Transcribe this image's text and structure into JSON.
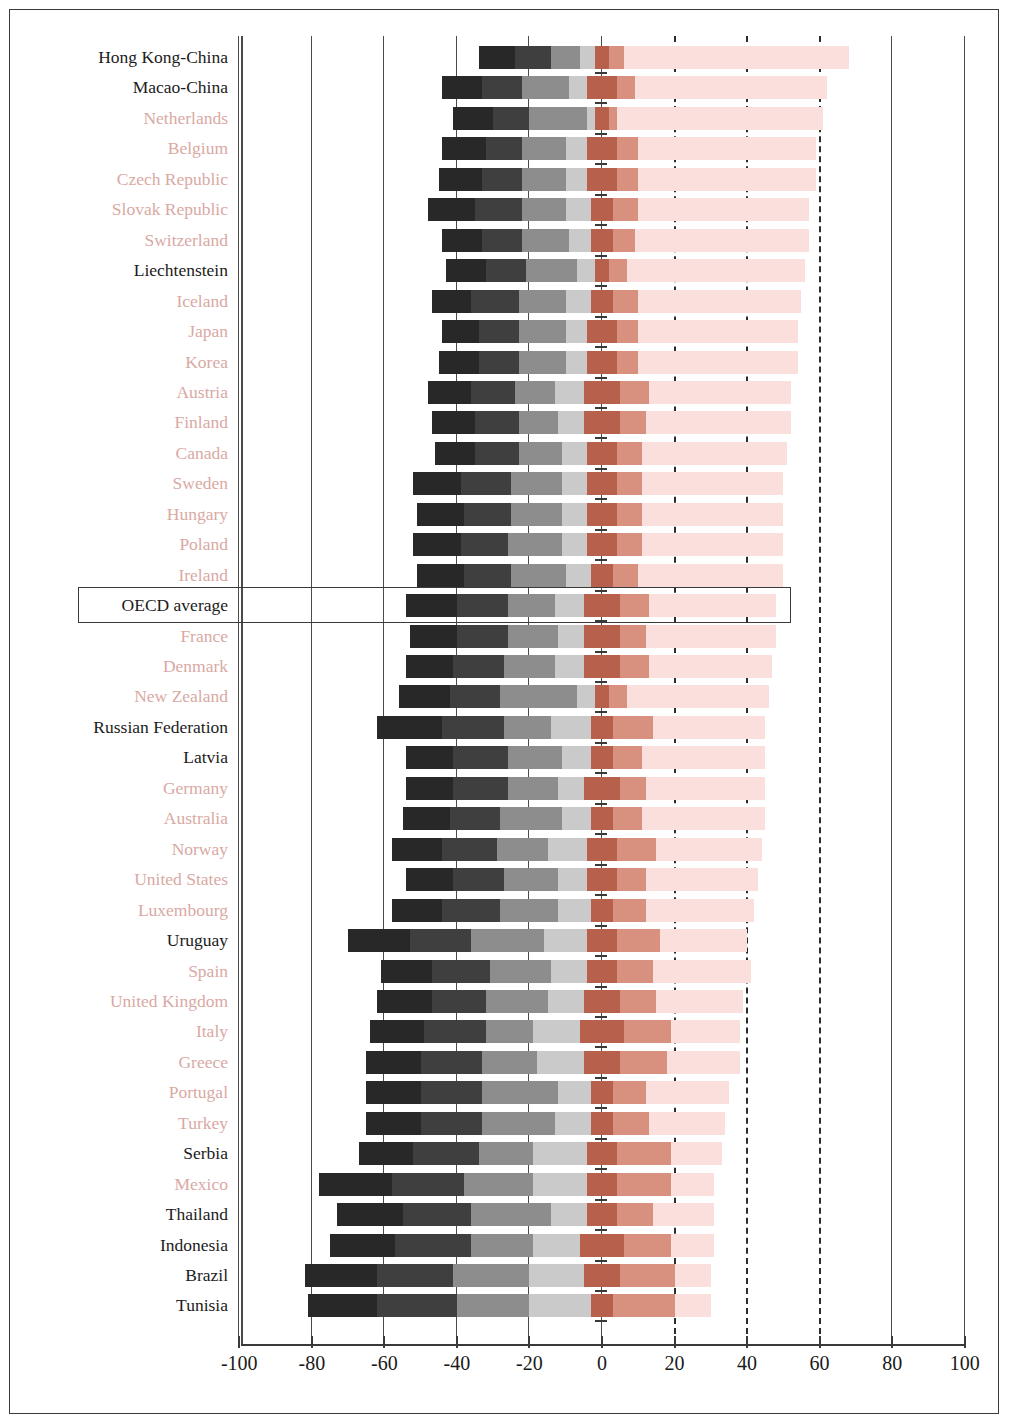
{
  "chart_data": {
    "type": "bar",
    "subtype": "diverging-stacked-bar",
    "title": "",
    "xlabel": "",
    "ylabel": "",
    "xlim": [
      -100,
      100
    ],
    "xticks": [
      -100,
      -80,
      -60,
      -40,
      -20,
      0,
      20,
      40,
      60,
      80,
      100
    ],
    "xticklabels": [
      "-100",
      "-80",
      "-60",
      "-40",
      "-20",
      "0",
      "20",
      "40",
      "60",
      "80",
      "100"
    ],
    "grid": "vertical",
    "gridlines_solid": [
      -100,
      -80,
      -60,
      -40,
      -20,
      0,
      80,
      100
    ],
    "gridlines_dashed": [
      20,
      40,
      60
    ],
    "legend": "none",
    "highlight_row": "OECD average",
    "segment_colors": {
      "level_1_below": "#282828",
      "level_2": "#3f3f3f",
      "level_3": "#8d8d8d",
      "level_4": "#cacaca",
      "level_5": "#b7604b",
      "level_6": "#d8907f",
      "level_7_top": "#fadfdc"
    },
    "label_colors": {
      "dark": "#1b1b1b",
      "light": "#d9a9a4"
    },
    "categories": [
      "Hong Kong-China",
      "Macao-China",
      "Netherlands",
      "Belgium",
      "Czech Republic",
      "Slovak Republic",
      "Switzerland",
      "Liechtenstein",
      "Iceland",
      "Japan",
      "Korea",
      "Austria",
      "Finland",
      "Canada",
      "Sweden",
      "Hungary",
      "Poland",
      "Ireland",
      "OECD average",
      "France",
      "Denmark",
      "New Zealand",
      "Russian Federation",
      "Latvia",
      "Germany",
      "Australia",
      "Norway",
      "United States",
      "Luxembourg",
      "Uruguay",
      "Spain",
      "United Kingdom",
      "Italy",
      "Greece",
      "Portugal",
      "Turkey",
      "Serbia",
      "Mexico",
      "Thailand",
      "Indonesia",
      "Brazil",
      "Tunisia"
    ],
    "label_style": [
      "dark",
      "dark",
      "light",
      "light",
      "light",
      "light",
      "light",
      "dark",
      "light",
      "light",
      "light",
      "light",
      "light",
      "light",
      "light",
      "light",
      "light",
      "light",
      "dark",
      "light",
      "light",
      "light",
      "dark",
      "dark",
      "light",
      "light",
      "light",
      "light",
      "light",
      "dark",
      "light",
      "light",
      "light",
      "light",
      "light",
      "light",
      "dark",
      "light",
      "dark",
      "dark",
      "dark",
      "dark"
    ],
    "rows": [
      {
        "name": "Hong Kong-China",
        "negative": [
          -34,
          -24,
          -14,
          -6,
          -2
        ],
        "positive": [
          2,
          6,
          68
        ]
      },
      {
        "name": "Macao-China",
        "negative": [
          -44,
          -33,
          -22,
          -9,
          -4
        ],
        "positive": [
          4,
          9,
          62
        ]
      },
      {
        "name": "Netherlands",
        "negative": [
          -41,
          -30,
          -20,
          -4,
          -2
        ],
        "positive": [
          2,
          4,
          61
        ]
      },
      {
        "name": "Belgium",
        "negative": [
          -44,
          -32,
          -22,
          -10,
          -4
        ],
        "positive": [
          4,
          10,
          59
        ]
      },
      {
        "name": "Czech Republic",
        "negative": [
          -45,
          -33,
          -22,
          -10,
          -4
        ],
        "positive": [
          4,
          10,
          59
        ]
      },
      {
        "name": "Slovak Republic",
        "negative": [
          -48,
          -35,
          -22,
          -10,
          -3
        ],
        "positive": [
          3,
          10,
          57
        ]
      },
      {
        "name": "Switzerland",
        "negative": [
          -44,
          -33,
          -22,
          -9,
          -3
        ],
        "positive": [
          3,
          9,
          57
        ]
      },
      {
        "name": "Liechtenstein",
        "negative": [
          -43,
          -32,
          -21,
          -7,
          -2
        ],
        "positive": [
          2,
          7,
          56
        ]
      },
      {
        "name": "Iceland",
        "negative": [
          -47,
          -36,
          -23,
          -10,
          -3
        ],
        "positive": [
          3,
          10,
          55
        ]
      },
      {
        "name": "Japan",
        "negative": [
          -44,
          -34,
          -23,
          -10,
          -4
        ],
        "positive": [
          4,
          10,
          54
        ]
      },
      {
        "name": "Korea",
        "negative": [
          -45,
          -34,
          -23,
          -10,
          -4
        ],
        "positive": [
          4,
          10,
          54
        ]
      },
      {
        "name": "Austria",
        "negative": [
          -48,
          -36,
          -24,
          -13,
          -5
        ],
        "positive": [
          5,
          13,
          52
        ]
      },
      {
        "name": "Finland",
        "negative": [
          -47,
          -35,
          -23,
          -12,
          -5
        ],
        "positive": [
          5,
          12,
          52
        ]
      },
      {
        "name": "Canada",
        "negative": [
          -46,
          -35,
          -23,
          -11,
          -4
        ],
        "positive": [
          4,
          11,
          51
        ]
      },
      {
        "name": "Sweden",
        "negative": [
          -52,
          -39,
          -25,
          -11,
          -4
        ],
        "positive": [
          4,
          11,
          50
        ]
      },
      {
        "name": "Hungary",
        "negative": [
          -51,
          -38,
          -25,
          -11,
          -4
        ],
        "positive": [
          4,
          11,
          50
        ]
      },
      {
        "name": "Poland",
        "negative": [
          -52,
          -39,
          -26,
          -11,
          -4
        ],
        "positive": [
          4,
          11,
          50
        ]
      },
      {
        "name": "Ireland",
        "negative": [
          -51,
          -38,
          -25,
          -10,
          -3
        ],
        "positive": [
          3,
          10,
          50
        ]
      },
      {
        "name": "OECD average",
        "negative": [
          -54,
          -40,
          -26,
          -13,
          -5
        ],
        "positive": [
          5,
          13,
          48
        ]
      },
      {
        "name": "France",
        "negative": [
          -53,
          -40,
          -26,
          -12,
          -5
        ],
        "positive": [
          5,
          12,
          48
        ]
      },
      {
        "name": "Denmark",
        "negative": [
          -54,
          -41,
          -27,
          -13,
          -5
        ],
        "positive": [
          5,
          13,
          47
        ]
      },
      {
        "name": "New Zealand",
        "negative": [
          -56,
          -42,
          -28,
          -7,
          -2
        ],
        "positive": [
          2,
          7,
          46
        ]
      },
      {
        "name": "Russian Federation",
        "negative": [
          -62,
          -44,
          -27,
          -14,
          -3
        ],
        "positive": [
          3,
          14,
          45
        ]
      },
      {
        "name": "Latvia",
        "negative": [
          -54,
          -41,
          -26,
          -11,
          -3
        ],
        "positive": [
          3,
          11,
          45
        ]
      },
      {
        "name": "Germany",
        "negative": [
          -54,
          -41,
          -26,
          -12,
          -5
        ],
        "positive": [
          5,
          12,
          45
        ]
      },
      {
        "name": "Australia",
        "negative": [
          -55,
          -42,
          -28,
          -11,
          -3
        ],
        "positive": [
          3,
          11,
          45
        ]
      },
      {
        "name": "Norway",
        "negative": [
          -58,
          -44,
          -29,
          -15,
          -4
        ],
        "positive": [
          4,
          15,
          44
        ]
      },
      {
        "name": "United States",
        "negative": [
          -54,
          -41,
          -27,
          -12,
          -4
        ],
        "positive": [
          4,
          12,
          43
        ]
      },
      {
        "name": "Luxembourg",
        "negative": [
          -58,
          -44,
          -28,
          -12,
          -3
        ],
        "positive": [
          3,
          12,
          42
        ]
      },
      {
        "name": "Uruguay",
        "negative": [
          -70,
          -53,
          -36,
          -16,
          -4
        ],
        "positive": [
          4,
          16,
          40
        ]
      },
      {
        "name": "Spain",
        "negative": [
          -61,
          -47,
          -31,
          -14,
          -4
        ],
        "positive": [
          4,
          14,
          41
        ]
      },
      {
        "name": "United Kingdom",
        "negative": [
          -62,
          -47,
          -32,
          -15,
          -5
        ],
        "positive": [
          5,
          15,
          39
        ]
      },
      {
        "name": "Italy",
        "negative": [
          -64,
          -49,
          -32,
          -19,
          -6
        ],
        "positive": [
          6,
          19,
          38
        ]
      },
      {
        "name": "Greece",
        "negative": [
          -65,
          -50,
          -33,
          -18,
          -5
        ],
        "positive": [
          5,
          18,
          38
        ]
      },
      {
        "name": "Portugal",
        "negative": [
          -65,
          -50,
          -33,
          -12,
          -3
        ],
        "positive": [
          3,
          12,
          35
        ]
      },
      {
        "name": "Turkey",
        "negative": [
          -65,
          -50,
          -33,
          -13,
          -3
        ],
        "positive": [
          3,
          13,
          34
        ]
      },
      {
        "name": "Serbia",
        "negative": [
          -67,
          -52,
          -34,
          -19,
          -4
        ],
        "positive": [
          4,
          19,
          33
        ]
      },
      {
        "name": "Mexico",
        "negative": [
          -78,
          -58,
          -38,
          -19,
          -4
        ],
        "positive": [
          4,
          19,
          31
        ]
      },
      {
        "name": "Thailand",
        "negative": [
          -73,
          -55,
          -36,
          -14,
          -4
        ],
        "positive": [
          4,
          14,
          31
        ]
      },
      {
        "name": "Indonesia",
        "negative": [
          -75,
          -57,
          -36,
          -19,
          -6
        ],
        "positive": [
          6,
          19,
          31
        ]
      },
      {
        "name": "Brazil",
        "negative": [
          -82,
          -62,
          -41,
          -20,
          -5
        ],
        "positive": [
          5,
          20,
          30
        ]
      },
      {
        "name": "Tunisia",
        "negative": [
          -81,
          -62,
          -40,
          -20,
          -3
        ],
        "positive": [
          3,
          20,
          30
        ]
      }
    ]
  },
  "axis": {
    "tick_labels": [
      "-100",
      "-80",
      "-60",
      "-40",
      "-20",
      "0",
      "20",
      "40",
      "60",
      "80",
      "100"
    ]
  },
  "highlight": {
    "label": "OECD average"
  }
}
